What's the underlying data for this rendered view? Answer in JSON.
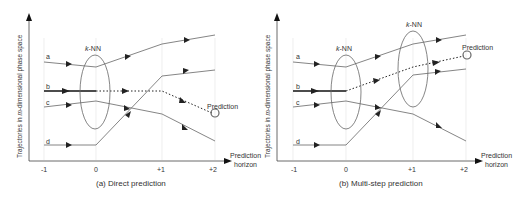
{
  "panels": [
    {
      "caption": "(a) Direct prediction",
      "y_axis_label": "Trajectories in m-dimensional phase space",
      "y_axis_label_prefix": "Trajectories in ",
      "y_axis_label_italic": "m",
      "y_axis_label_suffix": "-dimensional phase space",
      "x_axis_label_line1": "Prediction",
      "x_axis_label_line2": "horizon",
      "ticks": [
        "-1",
        "0",
        "+1",
        "+2"
      ],
      "trajectories": [
        "a",
        "b",
        "c",
        "d"
      ],
      "knn_labels": [
        {
          "k": "k",
          "rest": "-NN"
        }
      ],
      "prediction_label": "Prediction"
    },
    {
      "caption": "(b) Multi-step prediction",
      "y_axis_label": "Trajectories in m-dimensional phase space",
      "y_axis_label_prefix": "Trajectories in ",
      "y_axis_label_italic": "m",
      "y_axis_label_suffix": "-dimensional phase space",
      "x_axis_label_line1": "Prediction",
      "x_axis_label_line2": "horizon",
      "ticks": [
        "-1",
        "0",
        "+1",
        "+2"
      ],
      "trajectories": [
        "a",
        "b",
        "c",
        "d"
      ],
      "knn_labels": [
        {
          "k": "k",
          "rest": "-NN"
        },
        {
          "k": "k",
          "rest": "-NN"
        }
      ],
      "prediction_label": "Prediction"
    }
  ],
  "colors": {
    "line": "#555555",
    "bold_line": "#111111",
    "grid": "#dddddd",
    "text": "#333333"
  }
}
